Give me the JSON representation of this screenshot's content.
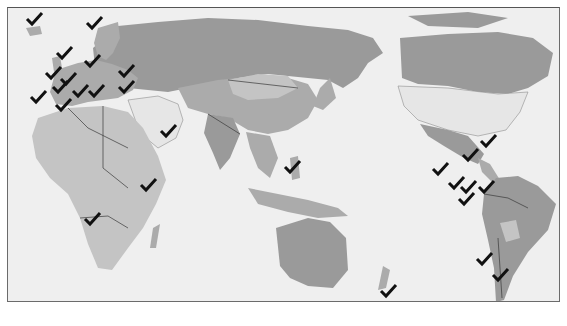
{
  "map": {
    "title": "",
    "projection": "pacific-centered world map",
    "colors": {
      "ocean": "#efefef",
      "land_primary": "#9a9a9a",
      "land_secondary": "#ababab",
      "land_tertiary": "#c4c4c4",
      "land_unmarked": "#e6e6e6",
      "checkmark": "#111111",
      "frame": "#6b6b6b"
    },
    "marker_icon": "checkmark-icon",
    "marked_locations": [
      {
        "name": "Iceland"
      },
      {
        "name": "Norway"
      },
      {
        "name": "United Kingdom"
      },
      {
        "name": "Sweden/Baltics"
      },
      {
        "name": "France"
      },
      {
        "name": "Germany"
      },
      {
        "name": "Ukraine"
      },
      {
        "name": "Spain"
      },
      {
        "name": "Portugal"
      },
      {
        "name": "Italy"
      },
      {
        "name": "Balkans"
      },
      {
        "name": "Turkey"
      },
      {
        "name": "Morocco"
      },
      {
        "name": "Yemen"
      },
      {
        "name": "Kenya"
      },
      {
        "name": "Namibia"
      },
      {
        "name": "Philippines"
      },
      {
        "name": "Cuba"
      },
      {
        "name": "Honduras"
      },
      {
        "name": "Guatemala"
      },
      {
        "name": "Costa Rica"
      },
      {
        "name": "Panama"
      },
      {
        "name": "Venezuela"
      },
      {
        "name": "Ecuador"
      },
      {
        "name": "Chile"
      },
      {
        "name": "Argentina"
      },
      {
        "name": "New Zealand"
      }
    ]
  }
}
